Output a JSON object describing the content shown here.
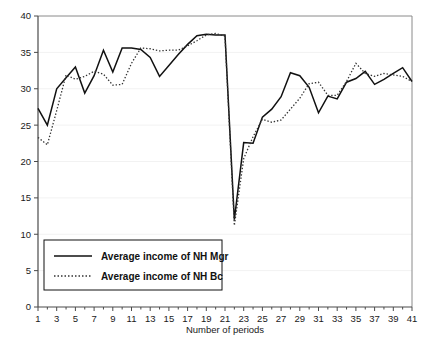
{
  "chart_data": {
    "type": "line",
    "title": "",
    "xlabel": "Number of periods",
    "ylabel": "",
    "xlim": [
      1,
      41
    ],
    "ylim": [
      0,
      40
    ],
    "ytick_step": 5,
    "xtick_step": 2,
    "grid": true,
    "grid_axis": "y",
    "legend_position": "lower-left-inside",
    "x": [
      1,
      2,
      3,
      4,
      5,
      6,
      7,
      8,
      9,
      10,
      11,
      12,
      13,
      14,
      15,
      16,
      17,
      18,
      19,
      20,
      21,
      22,
      23,
      24,
      25,
      26,
      27,
      28,
      29,
      30,
      31,
      32,
      33,
      34,
      35,
      36,
      37,
      38,
      39,
      40,
      41
    ],
    "ytick_labels": [
      "0",
      "5",
      "10",
      "15",
      "20",
      "25",
      "30",
      "35",
      "40"
    ],
    "xtick_labels": [
      "1",
      "3",
      "5",
      "7",
      "9",
      "11",
      "13",
      "15",
      "17",
      "19",
      "21",
      "23",
      "25",
      "27",
      "29",
      "31",
      "33",
      "35",
      "37",
      "39",
      "41"
    ],
    "series": [
      {
        "name": "Average income of NH Mgr",
        "style": "solid",
        "color": "#111111",
        "values": [
          27.3,
          25.0,
          30.0,
          31.5,
          33.0,
          29.4,
          31.8,
          35.3,
          32.3,
          35.6,
          35.6,
          35.4,
          34.3,
          31.7,
          33.2,
          34.7,
          36.1,
          37.3,
          37.5,
          37.4,
          37.4,
          12.0,
          22.6,
          22.5,
          26.1,
          27.2,
          28.9,
          32.2,
          31.8,
          30.2,
          26.7,
          29.0,
          28.6,
          30.9,
          31.4,
          32.4,
          30.6,
          31.3,
          32.1,
          32.9,
          31.0
        ]
      },
      {
        "name": "Average income of NH Bc",
        "style": "dotted",
        "color": "#333333",
        "values": [
          23.3,
          22.3,
          27.0,
          31.9,
          31.3,
          31.7,
          32.4,
          32.0,
          30.5,
          30.6,
          33.5,
          35.6,
          35.5,
          35.2,
          35.3,
          35.3,
          35.9,
          36.6,
          37.4,
          37.6,
          37.2,
          11.2,
          20.4,
          23.4,
          25.8,
          25.4,
          25.7,
          27.2,
          28.7,
          30.7,
          30.9,
          29.1,
          29.1,
          31.0,
          33.5,
          32.1,
          31.7,
          32.1,
          31.9,
          31.7,
          31.0
        ]
      }
    ],
    "annotations": []
  },
  "legend": {
    "entries": [
      {
        "label": "Average income of NH Mgr",
        "style": "solid"
      },
      {
        "label": "Average income of NH Bc",
        "style": "dotted"
      }
    ]
  }
}
